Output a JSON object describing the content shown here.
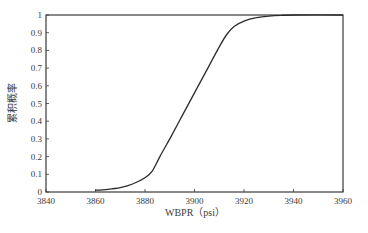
{
  "chart_data": {
    "type": "line",
    "title": "",
    "xlabel": "WBPR（psi）",
    "ylabel": "累积概率",
    "xlim": [
      3840,
      3960
    ],
    "ylim": [
      0,
      1
    ],
    "xticks": [
      3840,
      3860,
      3880,
      3900,
      3920,
      3940,
      3960
    ],
    "yticks": [
      0,
      0.1,
      0.2,
      0.3,
      0.4,
      0.5,
      0.6,
      0.7,
      0.8,
      0.9,
      1
    ],
    "ytick_labels": [
      "0",
      "0.1",
      "0.2",
      "0.3",
      "0.4",
      "0.5",
      "0.6",
      "0.7",
      "0.8",
      "0.9",
      "1"
    ],
    "grid": false,
    "legend": null,
    "series": [
      {
        "name": "CDF",
        "x": [
          3860,
          3865,
          3870,
          3875,
          3880,
          3883,
          3886,
          3890,
          3895,
          3900,
          3905,
          3910,
          3913,
          3916,
          3920,
          3925,
          3930,
          3935,
          3940
        ],
        "y": [
          0.01,
          0.015,
          0.025,
          0.045,
          0.08,
          0.12,
          0.2,
          0.3,
          0.43,
          0.56,
          0.69,
          0.82,
          0.89,
          0.935,
          0.965,
          0.985,
          0.994,
          0.998,
          1.0
        ]
      }
    ],
    "colors": {
      "line": "#2b2b2b",
      "axis": "#3a3a3a",
      "text": "#3a3a3a"
    }
  }
}
